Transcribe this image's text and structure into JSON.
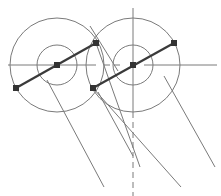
{
  "diagram": {
    "type": "geometric-construction",
    "colors": {
      "background": "#ffffff",
      "thin_line": "#7a7a7a",
      "thick_line": "#3a3a3a",
      "point": "#333333"
    },
    "circles": [
      {
        "id": "left-outer",
        "cx": 57,
        "cy": 65,
        "r": 47
      },
      {
        "id": "left-inner",
        "cx": 57,
        "cy": 65,
        "r": 20
      },
      {
        "id": "right-outer",
        "cx": 133,
        "cy": 65,
        "r": 47
      },
      {
        "id": "right-inner",
        "cx": 133,
        "cy": 65,
        "r": 20
      }
    ],
    "centerlines": [
      {
        "id": "left-horizontal",
        "x1": 8,
        "y1": 65,
        "x2": 96,
        "y2": 65,
        "dashed": false
      },
      {
        "id": "right-horizontal-dash",
        "x1": 104,
        "y1": 65,
        "x2": 122,
        "y2": 65,
        "dashed": true
      },
      {
        "id": "right-horizontal",
        "x1": 144,
        "y1": 65,
        "x2": 217,
        "y2": 65,
        "dashed": false
      },
      {
        "id": "right-vertical-top",
        "x1": 133,
        "y1": 8,
        "x2": 133,
        "y2": 112,
        "dashed": false
      },
      {
        "id": "right-vertical-dashed",
        "x1": 133,
        "y1": 112,
        "x2": 133,
        "y2": 196,
        "dashed": true
      }
    ],
    "thick_lines": [
      {
        "id": "left-diameter",
        "x1": 16,
        "y1": 88,
        "x2": 96,
        "y2": 43
      },
      {
        "id": "right-diameter",
        "x1": 93,
        "y1": 88,
        "x2": 174,
        "y2": 43
      }
    ],
    "thin_lines": [
      {
        "id": "tangent-a",
        "x1": 90,
        "y1": 26,
        "x2": 118,
        "y2": 71
      },
      {
        "id": "proj-1",
        "x1": 47,
        "y1": 80,
        "x2": 104,
        "y2": 187
      },
      {
        "id": "proj-2",
        "x1": 96,
        "y1": 43,
        "x2": 140,
        "y2": 167
      },
      {
        "id": "proj-3",
        "x1": 93,
        "y1": 88,
        "x2": 181,
        "y2": 187
      },
      {
        "id": "proj-4",
        "x1": 164,
        "y1": 76,
        "x2": 215,
        "y2": 167
      },
      {
        "id": "proj-5",
        "x1": 98,
        "y1": 92,
        "x2": 133,
        "y2": 156
      }
    ],
    "points": [
      {
        "id": "p-left-end",
        "x": 16,
        "y": 88
      },
      {
        "id": "p-left-center",
        "x": 57,
        "y": 65
      },
      {
        "id": "p-top-mid",
        "x": 96,
        "y": 43
      },
      {
        "id": "p-bottom-mid",
        "x": 93,
        "y": 88
      },
      {
        "id": "p-right-center",
        "x": 133,
        "y": 65
      },
      {
        "id": "p-right-end",
        "x": 174,
        "y": 43
      }
    ]
  }
}
